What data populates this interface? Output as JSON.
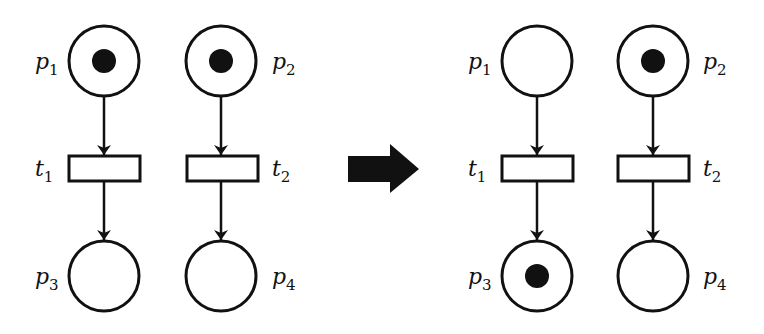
{
  "diagram": {
    "type": "petri-net-firing",
    "colors": {
      "stroke": "#111111",
      "token": "#111111",
      "background": "#ffffff",
      "firing_arrow": "#111111"
    },
    "before": {
      "places": [
        {
          "id": "p1",
          "letter": "p",
          "sub": "1",
          "tokens": 1
        },
        {
          "id": "p2",
          "letter": "p",
          "sub": "2",
          "tokens": 1
        },
        {
          "id": "p3",
          "letter": "p",
          "sub": "3",
          "tokens": 0
        },
        {
          "id": "p4",
          "letter": "p",
          "sub": "4",
          "tokens": 0
        }
      ],
      "transitions": [
        {
          "id": "t1",
          "letter": "t",
          "sub": "1"
        },
        {
          "id": "t2",
          "letter": "t",
          "sub": "2"
        }
      ],
      "arcs": [
        [
          "p1",
          "t1"
        ],
        [
          "t1",
          "p3"
        ],
        [
          "p2",
          "t2"
        ],
        [
          "t2",
          "p4"
        ]
      ]
    },
    "after": {
      "places": [
        {
          "id": "p1",
          "letter": "p",
          "sub": "1",
          "tokens": 0
        },
        {
          "id": "p2",
          "letter": "p",
          "sub": "2",
          "tokens": 1
        },
        {
          "id": "p3",
          "letter": "p",
          "sub": "3",
          "tokens": 1
        },
        {
          "id": "p4",
          "letter": "p",
          "sub": "4",
          "tokens": 0
        }
      ],
      "transitions": [
        {
          "id": "t1",
          "letter": "t",
          "sub": "1"
        },
        {
          "id": "t2",
          "letter": "t",
          "sub": "2"
        }
      ],
      "arcs": [
        [
          "p1",
          "t1"
        ],
        [
          "t1",
          "p3"
        ],
        [
          "p2",
          "t2"
        ],
        [
          "t2",
          "p4"
        ]
      ]
    },
    "firing_arrow_icon": "right-arrow-icon"
  }
}
